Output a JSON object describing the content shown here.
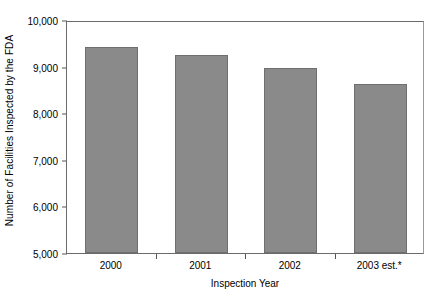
{
  "chart_data": {
    "type": "bar",
    "title": "",
    "subtitle": "",
    "xlabel": "Inspection Year",
    "ylabel": "Number of Facilities Inspected by the FDA",
    "categories": [
      "2000",
      "2001",
      "2002",
      "2003 est.*"
    ],
    "values": [
      9430,
      9250,
      8970,
      8620
    ],
    "series": [
      {
        "name": "Facilities Inspected",
        "values": [
          9430,
          9250,
          8970,
          8620
        ]
      }
    ],
    "ylim": [
      5000,
      10000
    ],
    "ytick_values": [
      5000,
      6000,
      7000,
      8000,
      9000,
      10000
    ],
    "ytick_labels": [
      "5,000",
      "6,000",
      "7,000",
      "8,000",
      "9,000",
      "10,000"
    ],
    "grid": false,
    "legend": null,
    "legend_position": "none",
    "annotations": [],
    "bar_color": "#8a8a8a",
    "bar_border_color": "#6f6f6f",
    "axis_color": "#6b6b6b",
    "text_color": "#000000",
    "background_color": "#ffffff"
  }
}
